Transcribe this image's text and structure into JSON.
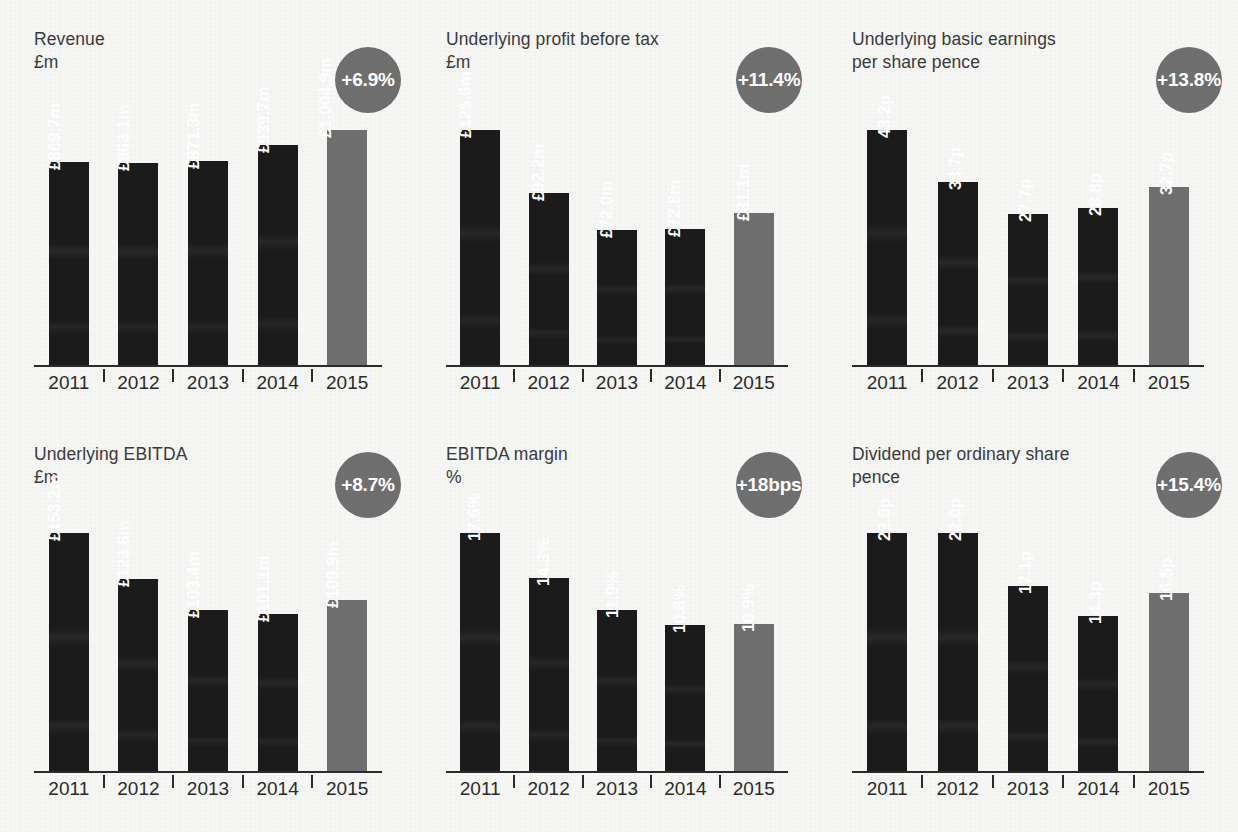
{
  "page": {
    "background_color": "#f6f6f4",
    "bar_color": "#1b1b1b",
    "highlight_bar_color": "#6f6f6f",
    "badge_color": "#6f6f6f",
    "axis_color": "#2b2b2b",
    "title_color": "#3b3b3b"
  },
  "chart_data": [
    {
      "id": "revenue",
      "type": "bar",
      "title": "Revenue",
      "unit": "£m",
      "ylabel": "£m",
      "xlabel": "",
      "badge": "+6.9%",
      "categories": [
        "2011",
        "2012",
        "2013",
        "2014",
        "2015"
      ],
      "values": [
        869.7,
        863.1,
        871.3,
        939.7,
        1004.9
      ],
      "value_labels": [
        "£869.7m",
        "£863.1m",
        "£871.3m",
        "£939.7m",
        "£1,004.9m"
      ],
      "highlight_index": 4,
      "ylim": [
        0,
        1004.9
      ],
      "grid": false,
      "legend": "none"
    },
    {
      "id": "underlying-profit-before-tax",
      "type": "bar",
      "title": "Underlying profit before tax",
      "unit": "£m",
      "ylabel": "£m",
      "xlabel": "",
      "badge": "+11.4%",
      "categories": [
        "2011",
        "2012",
        "2013",
        "2014",
        "2015"
      ],
      "values": [
        125.6,
        92.2,
        72.0,
        72.8,
        81.1
      ],
      "value_labels": [
        "£125.6m",
        "£92.2m",
        "£72.0m",
        "£72.8m",
        "£81.1m"
      ],
      "highlight_index": 4,
      "ylim": [
        0,
        125.6
      ],
      "grid": false,
      "legend": "none"
    },
    {
      "id": "underlying-basic-earnings-per-share",
      "type": "bar",
      "title": "Underlying basic earnings\nper share pence",
      "unit": "pence",
      "ylabel": "pence",
      "xlabel": "",
      "badge": "+13.8%",
      "categories": [
        "2011",
        "2012",
        "2013",
        "2014",
        "2015"
      ],
      "values": [
        43.2,
        33.7,
        27.7,
        28.8,
        32.7
      ],
      "value_labels": [
        "43.2p",
        "33.7p",
        "27.7p",
        "28.8p",
        "32.7p"
      ],
      "highlight_index": 4,
      "ylim": [
        0,
        43.2
      ],
      "grid": false,
      "legend": "none"
    },
    {
      "id": "underlying-ebitda",
      "type": "bar",
      "title": "Underlying EBITDA",
      "unit": "£m",
      "ylabel": "£m",
      "xlabel": "",
      "badge": "+8.7%",
      "categories": [
        "2011",
        "2012",
        "2013",
        "2014",
        "2015"
      ],
      "values": [
        153.2,
        123.6,
        103.4,
        101.1,
        109.9
      ],
      "value_labels": [
        "£153.2m",
        "£123.6m",
        "£103.4m",
        "£101.1m",
        "£109.9m"
      ],
      "highlight_index": 4,
      "ylim": [
        0,
        153.2
      ],
      "grid": false,
      "legend": "none"
    },
    {
      "id": "ebitda-margin",
      "type": "bar",
      "title": "EBITDA margin",
      "unit": "%",
      "ylabel": "%",
      "xlabel": "",
      "badge": "+18bps",
      "categories": [
        "2011",
        "2012",
        "2013",
        "2014",
        "2015"
      ],
      "values": [
        17.6,
        14.3,
        11.9,
        10.8,
        10.9
      ],
      "value_labels": [
        "17.6%",
        "14.3%",
        "11.9%",
        "10.8%",
        "10.9%"
      ],
      "highlight_index": 4,
      "ylim": [
        0,
        17.6
      ],
      "grid": false,
      "legend": "none"
    },
    {
      "id": "dividend-per-ordinary-share",
      "type": "bar",
      "title": "Dividend per ordinary share\npence",
      "unit": "pence",
      "ylabel": "pence",
      "xlabel": "",
      "badge": "+15.4%",
      "categories": [
        "2011",
        "2012",
        "2013",
        "2014",
        "2015"
      ],
      "values": [
        22.0,
        22.0,
        17.1,
        14.3,
        16.5
      ],
      "value_labels": [
        "22.0p",
        "22.0p",
        "17.1p",
        "14.3p",
        "16.5p"
      ],
      "highlight_index": 4,
      "ylim": [
        0,
        22.0
      ],
      "grid": false,
      "legend": "none"
    }
  ]
}
